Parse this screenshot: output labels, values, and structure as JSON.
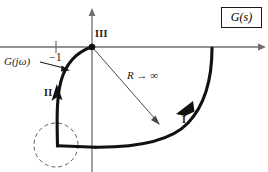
{
  "figure": {
    "type": "nyquist-plot",
    "title_box": {
      "label": "G(s)"
    },
    "background_color": "#ffffff",
    "ink_color": "#1a1a1a",
    "axis_color": "#6e6e6e"
  },
  "axes": {
    "real_axis": {
      "name": "horizontal-axis",
      "y": 47,
      "x_start": 0,
      "x_end": 265,
      "arrow": "right"
    },
    "imag_axis": {
      "name": "vertical-axis",
      "x": 92,
      "y_start": 9,
      "y_end": 172,
      "arrow": "up"
    },
    "origin": {
      "x": 92,
      "y": 47
    },
    "tick_minus_one": {
      "label": "−1",
      "x": 56,
      "y": 47
    }
  },
  "labels": {
    "minus_one": "−1",
    "transfer_function": "G(jω)",
    "segment_three": "III",
    "segment_two": "II",
    "segment_one": "I",
    "radius": "R → ∞"
  },
  "annotations": {
    "gjw_pointer": {
      "name": "gjw-leader-arrow",
      "from_x": 40,
      "from_y": 62,
      "to_x": 69,
      "to_y": 70
    },
    "radius_arrow": {
      "name": "radius-arrow",
      "from_x": 93,
      "from_y": 48,
      "to_x": 159,
      "to_y": 124
    },
    "dashed_circle": {
      "name": "indentation-circle",
      "cx": 56,
      "cy": 145,
      "r": 22,
      "dash": "4 3"
    }
  },
  "contour": {
    "segment_one": {
      "name": "large-semicircle-arc",
      "description": "Large arc of radius R from positive real axis sweeping clockwise down and left",
      "path": "M 212 48 C 212 80 206 105 190 122 C 172 141 135 147 95 147",
      "direction_arrow_at": {
        "x": 180,
        "y": 110
      }
    },
    "segment_two": {
      "name": "gjw-locus-curve",
      "description": "G(j-omega) locus rising from lower left toward the origin",
      "path": "M 57 146 C 57 120 56 92 63 74 C 70 58 82 50 92 47",
      "direction_arrow_at": {
        "x": 58,
        "y": 95
      }
    },
    "segment_three": {
      "name": "origin-point",
      "description": "Contour closes at the origin",
      "x": 92,
      "y": 47
    },
    "bottom_link": {
      "name": "bottom-horizontal-link",
      "path": "M 57 146 L 95 147"
    }
  }
}
